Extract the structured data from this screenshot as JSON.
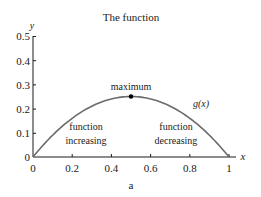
{
  "chart_data": {
    "type": "line",
    "title": "The function",
    "xlabel": "x",
    "ylabel": "y",
    "caption": "a",
    "xlim": [
      0,
      1
    ],
    "ylim": [
      0,
      0.5
    ],
    "grid": false,
    "x_ticks": [
      "0",
      "0.2",
      "0.4",
      "0.6",
      "0.8",
      "1"
    ],
    "y_ticks": [
      "0",
      "0.1",
      "0.2",
      "0.3",
      "0.4",
      "0.5"
    ],
    "series": [
      {
        "name": "g(x)",
        "formula": "x(1-x)",
        "x": [
          0,
          0.1,
          0.2,
          0.3,
          0.4,
          0.5,
          0.6,
          0.7,
          0.8,
          0.9,
          1.0
        ],
        "values": [
          0,
          0.09,
          0.16,
          0.21,
          0.24,
          0.25,
          0.24,
          0.21,
          0.16,
          0.09,
          0
        ]
      }
    ],
    "annotations": [
      {
        "text": "maximum",
        "x": 0.5,
        "y": 0.25,
        "marker": "point"
      },
      {
        "text": "function increasing",
        "lines": [
          "function",
          "increasing"
        ],
        "x": 0.27,
        "y": 0.1
      },
      {
        "text": "function decreasing",
        "lines": [
          "function",
          "decreasing"
        ],
        "x": 0.73,
        "y": 0.1
      },
      {
        "text": "g(x)",
        "x": 0.8,
        "y": 0.2
      }
    ],
    "colors": {
      "curve": "#6b6b6b",
      "axes": "#1a1a1a",
      "marker": "#000000"
    }
  }
}
